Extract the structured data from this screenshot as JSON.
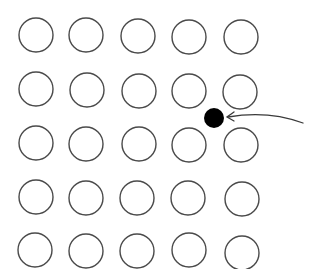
{
  "diagram": {
    "description": "5x5 grid of hollow circles with a solid black dot in the gap between rows 2-3 and columns 4-5, pointed to by a curved arrow from the right",
    "colors": {
      "background": "#ffffff",
      "circle_stroke": "#4a4a4a",
      "dot_fill": "#000000",
      "arrow_stroke": "#3a3a3a"
    },
    "grid": {
      "rows": 5,
      "cols": 5,
      "radius": 17,
      "circles": [
        {
          "row": 1,
          "col": 1,
          "cx": 36,
          "cy": 35
        },
        {
          "row": 1,
          "col": 2,
          "cx": 86,
          "cy": 35
        },
        {
          "row": 1,
          "col": 3,
          "cx": 138,
          "cy": 36
        },
        {
          "row": 1,
          "col": 4,
          "cx": 189,
          "cy": 37
        },
        {
          "row": 1,
          "col": 5,
          "cx": 241,
          "cy": 37
        },
        {
          "row": 2,
          "col": 1,
          "cx": 36,
          "cy": 89
        },
        {
          "row": 2,
          "col": 2,
          "cx": 87,
          "cy": 90
        },
        {
          "row": 2,
          "col": 3,
          "cx": 139,
          "cy": 91
        },
        {
          "row": 2,
          "col": 4,
          "cx": 189,
          "cy": 91
        },
        {
          "row": 2,
          "col": 5,
          "cx": 240,
          "cy": 92
        },
        {
          "row": 3,
          "col": 1,
          "cx": 36,
          "cy": 143
        },
        {
          "row": 3,
          "col": 2,
          "cx": 86,
          "cy": 144
        },
        {
          "row": 3,
          "col": 3,
          "cx": 139,
          "cy": 144
        },
        {
          "row": 3,
          "col": 4,
          "cx": 189,
          "cy": 145
        },
        {
          "row": 3,
          "col": 5,
          "cx": 241,
          "cy": 145
        },
        {
          "row": 4,
          "col": 1,
          "cx": 36,
          "cy": 197
        },
        {
          "row": 4,
          "col": 2,
          "cx": 86,
          "cy": 198
        },
        {
          "row": 4,
          "col": 3,
          "cx": 137,
          "cy": 198
        },
        {
          "row": 4,
          "col": 4,
          "cx": 188,
          "cy": 198
        },
        {
          "row": 4,
          "col": 5,
          "cx": 242,
          "cy": 199
        },
        {
          "row": 5,
          "col": 1,
          "cx": 35,
          "cy": 250
        },
        {
          "row": 5,
          "col": 2,
          "cx": 86,
          "cy": 251
        },
        {
          "row": 5,
          "col": 3,
          "cx": 137,
          "cy": 251
        },
        {
          "row": 5,
          "col": 4,
          "cx": 189,
          "cy": 250
        },
        {
          "row": 5,
          "col": 5,
          "cx": 242,
          "cy": 253
        }
      ]
    },
    "highlight_dot": {
      "cx": 214,
      "cy": 118,
      "r": 10,
      "position": "between row 2 and row 3, between column 4 and column 5"
    },
    "arrow": {
      "path": "M 303 123 Q 268 110 228 117",
      "head": "M 234 112 L 227 117 L 234 121",
      "direction": "points left toward the black dot"
    }
  }
}
